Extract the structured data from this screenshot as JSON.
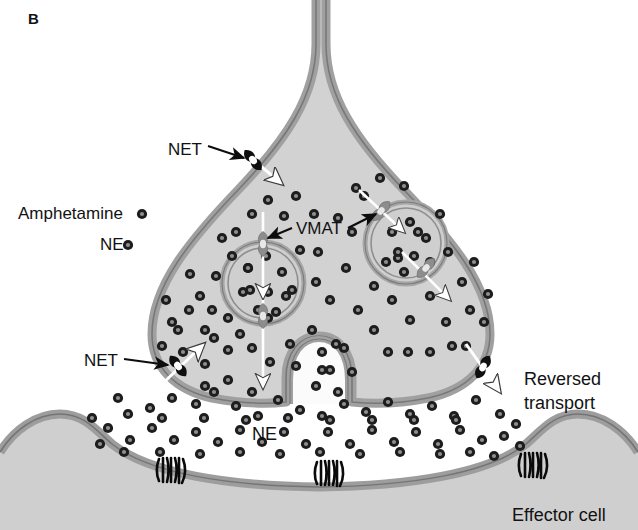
{
  "figure": {
    "panel_label": "B",
    "type": "diagram"
  },
  "colors": {
    "background": "#ffffff",
    "cytoplasm": "#d2d2d2",
    "membrane": "#9a9a9a",
    "membrane_edge": "#7d7d7d",
    "vesicle_ring": "#a8a8a8",
    "vesicle_lumen": "#cfcfcf",
    "transporter_net": "#111111",
    "transporter_vmat": "#8c8c8c",
    "dot_ring": "#1d1d1d",
    "dot_core": "#8f8f8f",
    "cleft": "#fbfbfb",
    "effector_fill": "#cfcfcf",
    "text": "#121212",
    "arrow_white": "#ffffff",
    "arrow_black": "#000000"
  },
  "legend": {
    "items": [
      {
        "label": "Amphetamine",
        "marker": "particle-dot",
        "x": 18,
        "y": 214
      },
      {
        "label": "NE",
        "marker": "particle-dot",
        "x": 100,
        "y": 245
      }
    ]
  },
  "labels": [
    {
      "name": "label-net-top",
      "text": "NET",
      "x": 168,
      "y": 150,
      "anchor": "start"
    },
    {
      "name": "label-net-left",
      "text": "NET",
      "x": 84,
      "y": 364,
      "anchor": "start"
    },
    {
      "name": "label-vmat",
      "text": "VMAT",
      "x": 294,
      "y": 231,
      "anchor": "start"
    },
    {
      "name": "label-ne-cleft",
      "text": "NE",
      "x": 252,
      "y": 434,
      "anchor": "start"
    },
    {
      "name": "label-reversed-1",
      "text": "Reversed",
      "x": 524,
      "y": 379,
      "anchor": "start"
    },
    {
      "name": "label-reversed-2",
      "text": "transport",
      "x": 524,
      "y": 402,
      "anchor": "start"
    },
    {
      "name": "label-effector-cell",
      "text": "Effector cell",
      "x": 512,
      "y": 516,
      "anchor": "start"
    }
  ],
  "structures": {
    "nerve_terminal": {
      "name": "presynaptic-nerve-terminal",
      "description": "axon neck widening into bouton"
    },
    "synaptic_cleft": {
      "name": "synaptic-cleft"
    },
    "effector_cell": {
      "name": "effector-cell"
    },
    "fusing_vesicle": {
      "name": "fusing-vesicle-omega"
    }
  },
  "transporters": {
    "net": [
      {
        "name": "net-top",
        "x": 253,
        "y": 158,
        "rot": -38,
        "arrow": "inward-down-right"
      },
      {
        "name": "net-lower-left",
        "x": 177,
        "y": 365,
        "rot": -36,
        "arrow": "inward-up-right"
      },
      {
        "name": "net-lower-right",
        "x": 484,
        "y": 368,
        "rot": 28,
        "arrow": "outward-down-right"
      }
    ],
    "vmat": [
      {
        "name": "vmat-left-top",
        "x": 263,
        "y": 244,
        "rot": 0,
        "arrow": "down"
      },
      {
        "name": "vmat-left-bottom",
        "x": 263,
        "y": 316,
        "rot": 0,
        "arrow": "down"
      },
      {
        "name": "vmat-right-top",
        "x": 383,
        "y": 212,
        "rot": 40,
        "arrow": "into-vesicle"
      },
      {
        "name": "vmat-right-bottom",
        "x": 424,
        "y": 266,
        "rot": 40,
        "arrow": "out-of-vesicle"
      }
    ]
  },
  "receptors": [
    {
      "name": "effector-receptor-left",
      "x": 172,
      "y": 470
    },
    {
      "name": "effector-receptor-center",
      "x": 330,
      "y": 472
    },
    {
      "name": "effector-receptor-right",
      "x": 534,
      "y": 464
    }
  ],
  "particles": {
    "cytoplasm_dots": [
      [
        200,
        296
      ],
      [
        216,
        276
      ],
      [
        232,
        256
      ],
      [
        243,
        292
      ],
      [
        228,
        318
      ],
      [
        205,
        330
      ],
      [
        189,
        310
      ],
      [
        183,
        352
      ],
      [
        205,
        364
      ],
      [
        228,
        380
      ],
      [
        252,
        392
      ],
      [
        205,
        386
      ],
      [
        178,
        330
      ],
      [
        166,
        300
      ],
      [
        296,
        196
      ],
      [
        314,
        214
      ],
      [
        300,
        250
      ],
      [
        316,
        282
      ],
      [
        330,
        300
      ],
      [
        346,
        268
      ],
      [
        352,
        232
      ],
      [
        364,
        196
      ],
      [
        380,
        178
      ],
      [
        404,
        186
      ],
      [
        290,
        344
      ],
      [
        312,
        330
      ],
      [
        336,
        344
      ],
      [
        252,
        214
      ],
      [
        236,
        232
      ],
      [
        222,
        238
      ],
      [
        268,
        200
      ],
      [
        284,
        216
      ],
      [
        358,
        310
      ],
      [
        374,
        330
      ],
      [
        392,
        300
      ],
      [
        410,
        320
      ],
      [
        430,
        296
      ],
      [
        446,
        322
      ],
      [
        462,
        282
      ],
      [
        448,
        252
      ],
      [
        470,
        310
      ],
      [
        430,
        352
      ],
      [
        452,
        346
      ],
      [
        408,
        352
      ],
      [
        388,
        352
      ],
      [
        466,
        346
      ],
      [
        484,
        322
      ],
      [
        252,
        348
      ],
      [
        270,
        362
      ],
      [
        228,
        350
      ],
      [
        214,
        338
      ],
      [
        190,
        274
      ],
      [
        172,
        322
      ],
      [
        162,
        346
      ],
      [
        248,
        268
      ],
      [
        292,
        290
      ],
      [
        318,
        252
      ],
      [
        338,
        218
      ],
      [
        356,
        188
      ],
      [
        418,
        232
      ],
      [
        440,
        214
      ],
      [
        398,
        258
      ],
      [
        374,
        286
      ],
      [
        488,
        294
      ],
      [
        474,
        262
      ],
      [
        212,
        310
      ],
      [
        240,
        334
      ],
      [
        268,
        318
      ],
      [
        296,
        366
      ],
      [
        322,
        370
      ]
    ],
    "vesicle_left_dots": [
      [
        248,
        268
      ],
      [
        266,
        256
      ],
      [
        282,
        272
      ],
      [
        250,
        290
      ],
      [
        268,
        292
      ],
      [
        286,
        296
      ],
      [
        258,
        310
      ],
      [
        276,
        312
      ]
    ],
    "vesicle_right_dots": [
      [
        392,
        232
      ],
      [
        410,
        222
      ],
      [
        426,
        238
      ],
      [
        398,
        252
      ],
      [
        414,
        256
      ],
      [
        430,
        262
      ],
      [
        404,
        272
      ],
      [
        386,
        262
      ]
    ],
    "fusing_vesicle_dots": [
      [
        322,
        352
      ],
      [
        344,
        348
      ],
      [
        330,
        370
      ],
      [
        352,
        372
      ],
      [
        316,
        386
      ],
      [
        338,
        392
      ]
    ],
    "cleft_dots": [
      [
        128,
        414
      ],
      [
        150,
        408
      ],
      [
        172,
        398
      ],
      [
        196,
        404
      ],
      [
        214,
        392
      ],
      [
        236,
        406
      ],
      [
        258,
        416
      ],
      [
        278,
        400
      ],
      [
        300,
        410
      ],
      [
        322,
        416
      ],
      [
        344,
        404
      ],
      [
        366,
        412
      ],
      [
        388,
        402
      ],
      [
        410,
        414
      ],
      [
        432,
        406
      ],
      [
        454,
        416
      ],
      [
        476,
        400
      ],
      [
        108,
        428
      ],
      [
        130,
        440
      ],
      [
        152,
        428
      ],
      [
        174,
        440
      ],
      [
        196,
        432
      ],
      [
        218,
        442
      ],
      [
        240,
        430
      ],
      [
        262,
        442
      ],
      [
        284,
        432
      ],
      [
        306,
        444
      ],
      [
        328,
        432
      ],
      [
        350,
        444
      ],
      [
        372,
        430
      ],
      [
        394,
        442
      ],
      [
        416,
        432
      ],
      [
        438,
        444
      ],
      [
        460,
        430
      ],
      [
        482,
        440
      ],
      [
        500,
        414
      ],
      [
        504,
        436
      ],
      [
        118,
        398
      ],
      [
        92,
        418
      ],
      [
        162,
        418
      ],
      [
        204,
        418
      ],
      [
        246,
        420
      ],
      [
        288,
        418
      ],
      [
        330,
        420
      ],
      [
        372,
        420
      ],
      [
        414,
        420
      ],
      [
        456,
        420
      ],
      [
        494,
        456
      ],
      [
        470,
        452
      ],
      [
        440,
        454
      ],
      [
        400,
        452
      ],
      [
        360,
        454
      ],
      [
        320,
        452
      ],
      [
        280,
        454
      ],
      [
        240,
        452
      ],
      [
        200,
        454
      ],
      [
        160,
        452
      ],
      [
        124,
        452
      ],
      [
        100,
        444
      ],
      [
        516,
        424
      ],
      [
        520,
        446
      ]
    ]
  }
}
